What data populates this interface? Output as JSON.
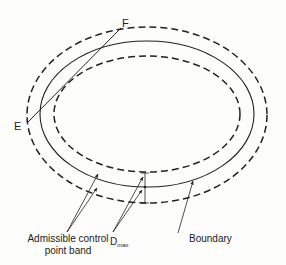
{
  "diagram": {
    "type": "concentric-ellipses",
    "labels": {
      "point_e": "E",
      "point_f": "F",
      "admissible_band": [
        "Admissible control",
        "point band"
      ],
      "dmax_main": "D",
      "dmax_sub": "max",
      "boundary": "Boundary"
    },
    "ellipses": [
      {
        "name": "outer-band-limit",
        "style": "dashed",
        "cx": 147,
        "cy": 115,
        "rx": 120,
        "ry": 88
      },
      {
        "name": "boundary",
        "style": "solid",
        "cx": 147,
        "cy": 114,
        "rx": 107,
        "ry": 73
      },
      {
        "name": "inner-band-limit",
        "style": "dashed",
        "cx": 147,
        "cy": 114,
        "rx": 93,
        "ry": 58
      }
    ],
    "segment_ef": {
      "from": [
        28,
        122
      ],
      "to": [
        121,
        28
      ]
    },
    "colors": {
      "line": "#222222",
      "background": "#fdfdfc"
    }
  }
}
